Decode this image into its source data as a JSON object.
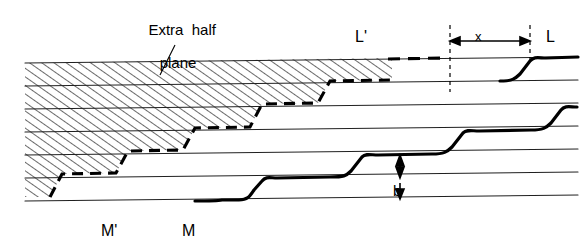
{
  "figure": {
    "type": "technical-line-diagram",
    "width": 586,
    "height": 247,
    "background_color": "#ffffff",
    "ink_color": "#000000",
    "labels": {
      "extra_half_plane_line1": "Extra  half",
      "extra_half_plane_line2": "plane",
      "L_prime": "L'",
      "L": "L",
      "x": "x",
      "b": "b",
      "M_prime": "M'",
      "M": "M"
    },
    "annotations": {
      "x_dimension": "x",
      "b_dimension": "b",
      "leader_target": "hatched extra half plane region"
    },
    "geometry": {
      "lattice_line_count": 8,
      "lattice_spacing_px": 23,
      "hatch_angle_deg": 60,
      "hatch_spacing_px": 7,
      "step_count": 5,
      "dashed_boundary": "extra half plane trailing edge",
      "solid_boundary": "slipped step front"
    },
    "colors": {
      "stroke": "#000000",
      "hatch": "#1a1a1a",
      "lattice": "#2b2b2b",
      "paper": "#ffffff"
    }
  }
}
